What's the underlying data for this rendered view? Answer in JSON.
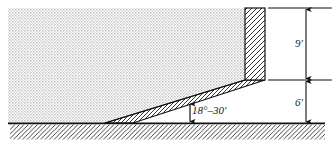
{
  "figure": {
    "type": "engineering-cross-section",
    "annotations": {
      "slope_angle": "18°–30'",
      "upper_height": "9'",
      "lower_height": "6'"
    },
    "colors": {
      "outline": "#111111",
      "stipple": "#c9c9c9",
      "hatch": "#2a2a2a",
      "background": "#ffffff"
    },
    "geometry": {
      "soil_left_x": 8,
      "soil_top_y": 8,
      "ground_y": 123,
      "ground_right_x": 325,
      "wall_left_x": 245,
      "wall_right_x": 265,
      "wall_top_y": 8,
      "wall_bottom_y": 80,
      "slope_toe_x": 105,
      "dimension_line_x": 306
    }
  }
}
